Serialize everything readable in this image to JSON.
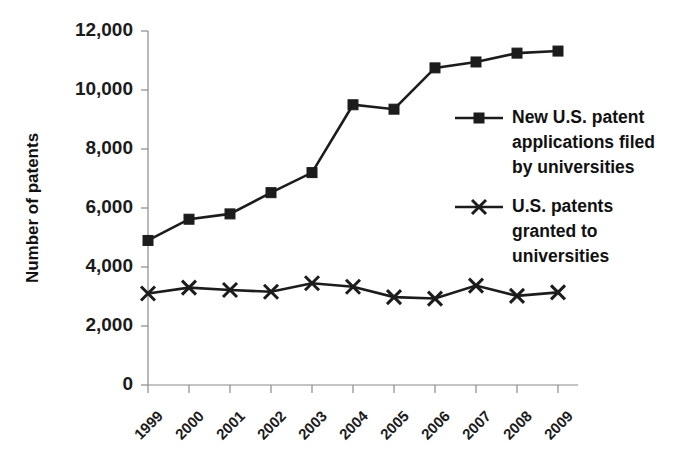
{
  "chart_data": {
    "type": "line",
    "title": "",
    "xlabel": "",
    "ylabel": "Number of patents",
    "ylim": [
      0,
      12000
    ],
    "ytick_values": [
      0,
      2000,
      4000,
      6000,
      8000,
      10000,
      12000
    ],
    "ytick_labels": [
      "0",
      "2,000",
      "4,000",
      "6,000",
      "8,000",
      "10,000",
      "12,000"
    ],
    "categories": [
      "1999",
      "2000",
      "2001",
      "2002",
      "2003",
      "2004",
      "2005",
      "2006",
      "2007",
      "2008",
      "2009"
    ],
    "grid": false,
    "legend_position": "right-center",
    "series": [
      {
        "name": "New U.S. patent applications filed by universities",
        "marker": "square",
        "values": [
          4900,
          5620,
          5800,
          6520,
          7200,
          9500,
          9350,
          10750,
          10950,
          11250,
          11320
        ]
      },
      {
        "name": "U.S. patents granted to universities",
        "marker": "x",
        "values": [
          3100,
          3300,
          3220,
          3160,
          3450,
          3330,
          2980,
          2930,
          3370,
          3020,
          3140
        ]
      }
    ]
  },
  "legend": {
    "entries": [
      {
        "marker": "square-marker-icon",
        "lines": [
          "New U.S. patent",
          "applications filed",
          "by universities"
        ]
      },
      {
        "marker": "x-marker-icon",
        "lines": [
          "U.S. patents",
          "granted to",
          "universities"
        ]
      }
    ]
  },
  "axis": {
    "y_title": "Number of patents"
  }
}
